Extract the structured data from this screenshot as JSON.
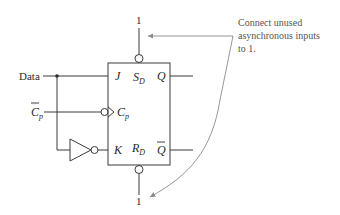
{
  "diagram": {
    "inputs": {
      "data_label": "Data",
      "clock_label": "C",
      "clock_sub": "p"
    },
    "pins": {
      "j": "J",
      "k": "K",
      "cp": "C",
      "cp_sub": "p",
      "sd": "S",
      "sd_sub": "D",
      "rd": "R",
      "rd_sub": "D",
      "q": "Q",
      "qbar": "Q"
    },
    "tie_high_top": "1",
    "tie_high_bottom": "1",
    "annotation": {
      "line1": "Connect unused",
      "line2": "asynchronous inputs",
      "line3": "to 1."
    }
  }
}
